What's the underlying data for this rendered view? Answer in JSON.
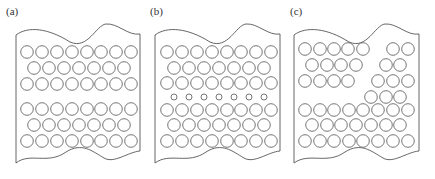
{
  "figure": {
    "stroke_color": "#555555",
    "pore_stroke_color": "#666666",
    "background": "#ffffff",
    "pore_radius": 6.3,
    "small_pore_radius": 3.0,
    "panels": [
      {
        "id": "a",
        "label": "(a)",
        "label_pos": [
          6,
          15
        ],
        "left": 16,
        "right": 140,
        "top_wave": [
          [
            16,
            35
          ],
          [
            28,
            26,
            48,
            28,
            70,
            42
          ],
          [
            88,
            50,
            96,
            25,
            106,
            24
          ],
          [
            118,
            23,
            128,
            36,
            140,
            34
          ]
        ],
        "bottom_wave": [
          [
            140,
            151
          ],
          [
            128,
            152,
            114,
            164,
            104,
            158
          ],
          [
            92,
            151,
            82,
            142,
            66,
            152
          ],
          [
            48,
            165,
            30,
            152,
            16,
            163
          ]
        ],
        "rows": [
          {
            "y": 52,
            "r": 6.3,
            "xs": [
              27,
              42,
              57,
              72,
              87,
              101,
              116,
              131
            ]
          },
          {
            "y": 68,
            "r": 6.3,
            "xs": [
              34,
              49,
              64,
              79,
              94,
              109,
              124
            ]
          },
          {
            "y": 84,
            "r": 6.3,
            "xs": [
              27,
              42,
              57,
              72,
              87,
              101,
              116,
              131
            ]
          },
          {
            "y": 109,
            "r": 6.3,
            "xs": [
              27,
              42,
              57,
              72,
              87,
              101,
              116,
              131
            ]
          },
          {
            "y": 125,
            "r": 6.3,
            "xs": [
              34,
              49,
              64,
              79,
              94,
              109,
              124
            ]
          },
          {
            "y": 141,
            "r": 6.3,
            "xs": [
              27,
              42,
              57,
              72,
              87,
              101,
              116,
              131
            ]
          }
        ]
      },
      {
        "id": "b",
        "label": "(b)",
        "label_pos": [
          150,
          15
        ],
        "left": 155,
        "right": 280,
        "top_wave": [
          [
            155,
            35
          ],
          [
            167,
            26,
            188,
            28,
            210,
            42
          ],
          [
            228,
            50,
            236,
            25,
            246,
            24
          ],
          [
            258,
            23,
            268,
            36,
            280,
            34
          ]
        ],
        "bottom_wave": [
          [
            280,
            151
          ],
          [
            268,
            152,
            254,
            164,
            244,
            158
          ],
          [
            232,
            151,
            222,
            142,
            206,
            152
          ],
          [
            188,
            165,
            170,
            152,
            155,
            163
          ]
        ],
        "rows": [
          {
            "y": 52,
            "r": 6.3,
            "xs": [
              167,
              182,
              197,
              212,
              227,
              241,
              256,
              271
            ]
          },
          {
            "y": 68,
            "r": 6.3,
            "xs": [
              174,
              189,
              204,
              219,
              234,
              249,
              264
            ]
          },
          {
            "y": 83,
            "r": 6.3,
            "xs": [
              167,
              182,
              197,
              212,
              227,
              241,
              256,
              271
            ]
          },
          {
            "y": 97,
            "r": 3.0,
            "xs": [
              174,
              189,
              204,
              219,
              234,
              249,
              264
            ]
          },
          {
            "y": 110,
            "r": 6.3,
            "xs": [
              167,
              182,
              197,
              212,
              227,
              241,
              256,
              271
            ]
          },
          {
            "y": 125,
            "r": 6.3,
            "xs": [
              174,
              189,
              204,
              219,
              234,
              249,
              264
            ]
          },
          {
            "y": 141,
            "r": 6.3,
            "xs": [
              167,
              182,
              197,
              212,
              227,
              241,
              256,
              271
            ]
          }
        ]
      },
      {
        "id": "c",
        "label": "(c)",
        "label_pos": [
          290,
          15
        ],
        "left": 294,
        "right": 419,
        "top_wave": [
          [
            294,
            35
          ],
          [
            306,
            26,
            327,
            28,
            349,
            42
          ],
          [
            367,
            50,
            375,
            25,
            385,
            24
          ],
          [
            397,
            23,
            407,
            36,
            419,
            34
          ]
        ],
        "bottom_wave": [
          [
            419,
            151
          ],
          [
            407,
            152,
            393,
            164,
            383,
            158
          ],
          [
            371,
            151,
            361,
            142,
            345,
            152
          ],
          [
            327,
            165,
            309,
            152,
            294,
            163
          ]
        ],
        "rows": [
          {
            "y": 49,
            "r": 6.3,
            "xs": [
              305,
              320,
              334,
              348,
              363,
              393,
              408
            ]
          },
          {
            "y": 65,
            "r": 6.3,
            "xs": [
              312,
              327,
              341,
              356,
              386,
              400
            ]
          },
          {
            "y": 81,
            "r": 6.3,
            "xs": [
              305,
              320,
              334,
              348,
              378,
              393,
              408
            ]
          },
          {
            "y": 97,
            "r": 6.3,
            "xs": [
              371,
              386,
              400
            ]
          },
          {
            "y": 110,
            "r": 6.3,
            "xs": [
              305,
              320,
              334,
              349,
              363,
              378,
              393,
              408
            ]
          },
          {
            "y": 125,
            "r": 6.3,
            "xs": [
              312,
              327,
              341,
              356,
              371,
              386,
              400
            ]
          },
          {
            "y": 141,
            "r": 6.3,
            "xs": [
              305,
              320,
              334,
              349,
              363,
              378,
              393,
              408
            ]
          }
        ]
      }
    ]
  }
}
